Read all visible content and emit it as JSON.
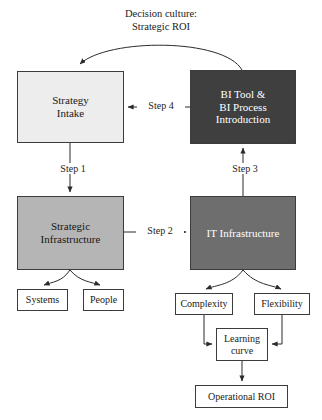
{
  "diagram": {
    "title_caption": "Decision culture:\nStrategic ROI",
    "nodes": {
      "strategy_intake": "Strategy\nIntake",
      "bi_tool": "BI Tool &\nBI Process\nIntroduction",
      "strategic_infrastructure": "Strategic\nInfrastructure",
      "it_infrastructure": "IT Infrastructure",
      "systems": "Systems",
      "people": "People",
      "complexity": "Complexity",
      "flexibility": "Flexibility",
      "learning_curve": "Learning\ncurve",
      "operational_roi": "Operational ROI"
    },
    "edges": {
      "step1": "Step 1",
      "step2": "Step 2",
      "step3": "Step 3",
      "step4": "Step 4"
    },
    "colors": {
      "strategy_intake_fill": "#ededed",
      "bi_tool_fill": "#3f3f3f",
      "strategic_infrastructure_fill": "#b5b5b5",
      "it_infrastructure_fill": "#6e6e6e",
      "leaf_fill": "#ffffff",
      "stroke": "#3c3c3c",
      "background": "#ffffff"
    }
  }
}
